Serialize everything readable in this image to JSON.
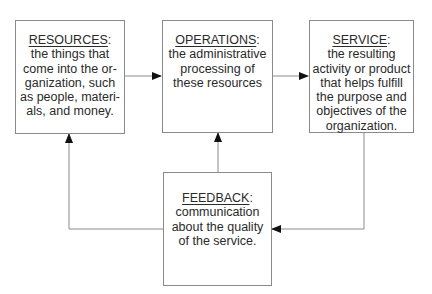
{
  "diagram": {
    "boxes": {
      "resources": {
        "title": "RESOURCES",
        "suffix": ":",
        "lines": [
          "the things that",
          "come into the or-",
          "ganization, such",
          "as people, materi-",
          "als, and money."
        ]
      },
      "operations": {
        "title": "OPERATIONS",
        "suffix": ":",
        "lines": [
          "the administrative",
          "processing of",
          "these resources"
        ]
      },
      "service": {
        "title": "SERVICE",
        "suffix": ":",
        "lines": [
          "the resulting",
          "activity or product",
          "that helps fulfill",
          "the purpose and",
          "objectives of the",
          "organization."
        ]
      },
      "feedback": {
        "title": "FEEDBACK",
        "suffix": ":",
        "lines": [
          "communication",
          "about the quality",
          "of the service."
        ]
      }
    },
    "connections": [
      {
        "from": "resources",
        "to": "operations"
      },
      {
        "from": "operations",
        "to": "service"
      },
      {
        "from": "service",
        "to": "feedback"
      },
      {
        "from": "feedback",
        "to": "operations"
      },
      {
        "from": "feedback",
        "to": "resources"
      }
    ],
    "colors": {
      "line": "#8a8a8a",
      "arrowhead": "#111111",
      "text": "#2a2a2a"
    }
  }
}
